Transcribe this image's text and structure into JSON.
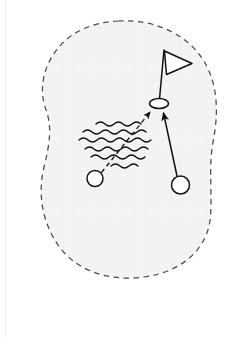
{
  "page": {
    "background_color": "#ffffff",
    "width": 247,
    "height": 337
  },
  "diagram": {
    "type": "golf-hole-schematic",
    "green": {
      "name": "green-area",
      "outline_style": "dashed",
      "outline_color": "#555555",
      "fill_color": "#f4f4f4",
      "grid_texture_color": "#ededed",
      "shape": "kidney",
      "bounds": {
        "x": 30,
        "y": 20,
        "width": 188,
        "height": 258
      }
    },
    "hole": {
      "name": "hole-cup",
      "label": "hole",
      "cx": 159,
      "cy": 103,
      "rx": 9.5,
      "ry": 5,
      "stroke_color": "#111111"
    },
    "flag": {
      "name": "flagstick",
      "label": "flag",
      "pole_top_x": 164,
      "pole_top_y": 50,
      "pole_bottom_x": 159,
      "pole_bottom_y": 99,
      "flag_points": "164,50 192,63 166,74",
      "stroke_color": "#111111"
    },
    "hazard": {
      "name": "water-hazard",
      "label": "water",
      "stroke_color": "#111111",
      "wave_count": 6,
      "bounds": {
        "x": 78,
        "y": 120,
        "width": 68,
        "height": 50
      }
    },
    "balls": [
      {
        "name": "ball-left",
        "label": "ball A",
        "cx": 95,
        "cy": 178,
        "r": 8,
        "stroke_color": "#111111"
      },
      {
        "name": "ball-right",
        "label": "ball B",
        "cx": 180,
        "cy": 185,
        "r": 9,
        "stroke_color": "#111111"
      }
    ],
    "trajectories": [
      {
        "name": "trajectory-dashed",
        "label": "path A",
        "style": "dashed",
        "from_x": 101,
        "from_y": 172,
        "to_x": 150,
        "to_y": 112,
        "stroke_color": "#111111",
        "crosses_hazard": true
      },
      {
        "name": "trajectory-solid",
        "label": "path B",
        "style": "solid",
        "from_x": 177,
        "from_y": 176,
        "to_x": 163,
        "to_y": 112,
        "stroke_color": "#111111",
        "crosses_hazard": false
      }
    ]
  }
}
